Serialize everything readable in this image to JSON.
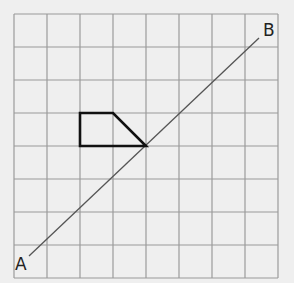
{
  "diagram": {
    "type": "grid-reflection",
    "grid": {
      "columns": 8,
      "rows": 8,
      "origin_px": [
        14,
        14
      ],
      "cell_px": 33,
      "line_color": "#9a9a9a"
    },
    "mirror_line": {
      "from_label": "A",
      "to_label": "B",
      "from_px": [
        29,
        256
      ],
      "to_px": [
        259,
        38
      ],
      "color": "#555555"
    },
    "shape": {
      "name": "quadrilateral",
      "points_grid": [
        [
          2,
          3
        ],
        [
          3,
          3
        ],
        [
          4,
          4
        ],
        [
          2,
          4
        ]
      ],
      "stroke": "#111111"
    },
    "labels": {
      "a": "A",
      "b": "B"
    }
  }
}
